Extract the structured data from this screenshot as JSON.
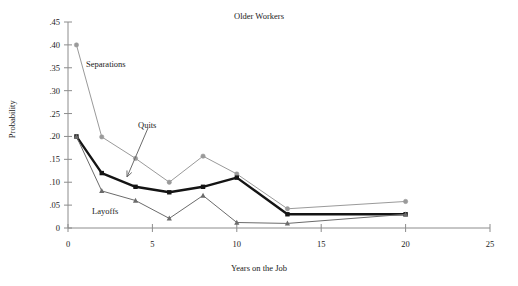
{
  "chart_data": {
    "type": "line",
    "title": "Older Workers",
    "xlabel": "Years on the Job",
    "ylabel": "Probability",
    "xlim": [
      0,
      25
    ],
    "ylim": [
      0,
      0.45
    ],
    "grid": false,
    "legend_position": "inline-annotations",
    "x_ticks": [
      0,
      5,
      10,
      15,
      20,
      25
    ],
    "x_tick_labels": [
      "0",
      "5",
      "10",
      "15",
      "20",
      "25"
    ],
    "y_ticks": [
      0,
      0.05,
      0.1,
      0.15,
      0.2,
      0.25,
      0.3,
      0.35,
      0.4,
      0.45
    ],
    "y_tick_labels": [
      "0",
      ".05",
      ".10",
      ".15",
      ".20",
      ".25",
      ".30",
      ".35",
      ".40",
      ".45"
    ],
    "x": [
      0.5,
      2,
      4,
      6,
      8,
      10,
      13,
      20
    ],
    "series": [
      {
        "name": "Separations",
        "color": "#9a9a9a",
        "marker": "circle",
        "line_width": 1,
        "values": [
          0.4,
          0.199,
          0.152,
          0.1,
          0.157,
          0.118,
          0.042,
          0.058
        ]
      },
      {
        "name": "Quits",
        "color": "#141414",
        "marker": "square",
        "line_width": 2.4,
        "values": [
          0.2,
          0.12,
          0.09,
          0.078,
          0.09,
          0.11,
          0.03,
          0.03
        ]
      },
      {
        "name": "Layoffs",
        "color": "#6b6b6b",
        "marker": "triangle",
        "line_width": 1,
        "values": [
          0.2,
          0.081,
          0.06,
          0.021,
          0.071,
          0.012,
          0.01,
          0.03
        ]
      }
    ],
    "annotations": [
      {
        "text": "Separations",
        "x_px": 86,
        "y_px": 60,
        "has_arrow": false
      },
      {
        "text": "Quits",
        "x_px": 138,
        "y_px": 121,
        "has_arrow": true,
        "arrow_from_x_px": 148,
        "arrow_from_y_px": 128,
        "arrow_to_x_px": 127,
        "arrow_to_y_px": 177
      },
      {
        "text": "Layoffs",
        "x_px": 92,
        "y_px": 207,
        "has_arrow": false
      }
    ]
  }
}
